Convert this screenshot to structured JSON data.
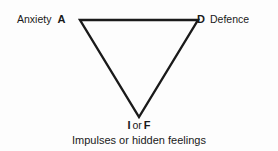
{
  "diagram": {
    "stroke_color": "#1a1a1a",
    "background_color": "#fdfdfd",
    "shape": "inverted-triangle",
    "vertices": [
      {
        "id": "A",
        "letter": "A",
        "label": "Anxiety",
        "position": "top-left",
        "x": 80,
        "y": 20
      },
      {
        "id": "D",
        "letter": "D",
        "label": "Defence",
        "position": "top-right",
        "x": 198,
        "y": 20
      },
      {
        "id": "IF",
        "letter_1": "I",
        "conjunction": "or",
        "letter_2": "F",
        "label": "Impulses or hidden feelings",
        "position": "bottom-apex",
        "x": 139,
        "y": 117
      }
    ]
  },
  "labels": {
    "anxiety_text": "Anxiety",
    "anxiety_letter": "A",
    "defence_letter": "D",
    "defence_text": "Defence",
    "apex_letter_1": "I",
    "apex_conjunction": "or",
    "apex_letter_2": "F",
    "caption": "Impulses or hidden feelings"
  }
}
